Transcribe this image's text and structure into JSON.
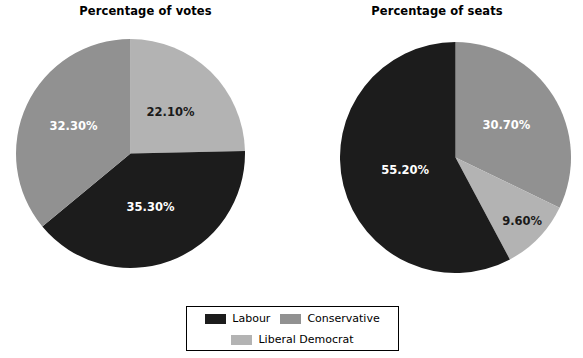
{
  "colors": {
    "labour": "#1c1c1c",
    "conservative": "#919191",
    "liberal_democrat": "#b3b3b3",
    "background": "#ffffff",
    "legend_border": "#000000",
    "label_dark": "#1a1a1a",
    "label_light": "#ffffff"
  },
  "legend": {
    "items": [
      {
        "label": "Labour",
        "color": "#1c1c1c"
      },
      {
        "label": "Conservative",
        "color": "#919191"
      },
      {
        "label": "Liberal Democrat",
        "color": "#b3b3b3"
      }
    ]
  },
  "chart_data": [
    {
      "type": "pie",
      "title": "Percentage of votes",
      "categories": [
        "Liberal Democrat",
        "Labour",
        "Conservative"
      ],
      "values": [
        22.1,
        35.3,
        32.3
      ],
      "labels": [
        "22.10%",
        "35.30%",
        "32.30%"
      ],
      "colors": [
        "#b3b3b3",
        "#1c1c1c",
        "#919191"
      ],
      "label_colors": [
        "#1a1a1a",
        "#ffffff",
        "#ffffff"
      ],
      "start_angle_deg": 0,
      "direction": "clockwise",
      "legend_position": "bottom"
    },
    {
      "type": "pie",
      "title": "Percentage of seats",
      "categories": [
        "Conservative",
        "Liberal Democrat",
        "Labour"
      ],
      "values": [
        30.7,
        9.6,
        55.2
      ],
      "labels": [
        "30.70%",
        "9.60%",
        "55.20%"
      ],
      "colors": [
        "#919191",
        "#b3b3b3",
        "#1c1c1c"
      ],
      "label_colors": [
        "#ffffff",
        "#1a1a1a",
        "#ffffff"
      ],
      "start_angle_deg": 0,
      "direction": "clockwise",
      "legend_position": "bottom"
    }
  ]
}
